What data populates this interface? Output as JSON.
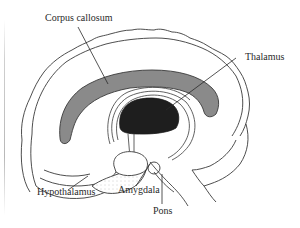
{
  "diagram": {
    "type": "anatomical-illustration",
    "labels": [
      {
        "id": "corpus-callosum",
        "text": "Corpus callosum"
      },
      {
        "id": "thalamus",
        "text": "Thalamus"
      },
      {
        "id": "hypothalamus",
        "text": "Hypothalamus"
      },
      {
        "id": "amygdala",
        "text": "Amygdala"
      },
      {
        "id": "pons",
        "text": "Pons"
      }
    ],
    "colors": {
      "outline": "#3a3a3a",
      "corpus_callosum_fill": "#8a8a8a",
      "thalamus_fill": "#1e1e1e",
      "background": "#ffffff",
      "stipple": "#b0b0b0"
    }
  }
}
